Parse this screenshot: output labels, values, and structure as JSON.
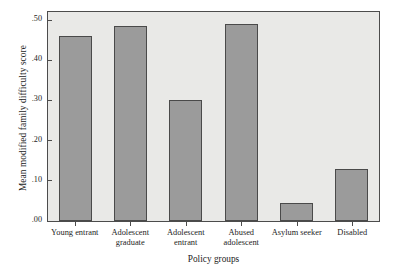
{
  "chart_data": {
    "type": "bar",
    "title": "",
    "subtitle": "",
    "xlabel": "Policy groups",
    "ylabel": "Mean modified family difficulty score",
    "categories": [
      "Young entrant",
      "Adolescent graduate",
      "Adolescent entrant",
      "Abused adolescent",
      "Asylum seeker",
      "Disabled"
    ],
    "values": [
      0.46,
      0.485,
      0.3,
      0.49,
      0.045,
      0.13
    ],
    "ylim": [
      0.0,
      0.52
    ],
    "yticks": [
      0.0,
      0.1,
      0.2,
      0.3,
      0.4,
      0.5
    ],
    "ytick_labels": [
      ".00",
      ".10",
      ".20",
      ".30",
      ".40",
      ".50"
    ],
    "grid": false,
    "legend": "none",
    "bar_color": "#9b9b9b",
    "bar_edge_color": "#4a4a4a",
    "plot_background": "#e9e9e7",
    "frame_color": "#4c4c4c",
    "annotations": []
  },
  "axes": {
    "y_title": "Mean modified family difficulty score",
    "x_title": "Policy groups",
    "y_tick_labels": [
      ".50",
      ".40",
      ".30",
      ".20",
      ".10",
      ".00"
    ],
    "x_tick_labels": [
      "Young entrant",
      "Adolescent graduate",
      "Adolescent entrant",
      "Abused adolescent",
      "Asylum seeker",
      "Disabled"
    ]
  }
}
